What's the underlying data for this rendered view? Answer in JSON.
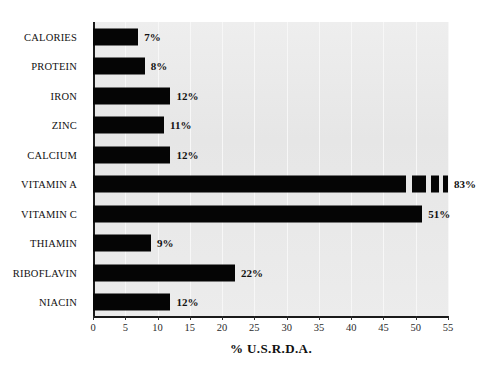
{
  "chart_data": {
    "type": "bar",
    "orientation": "horizontal",
    "title": "",
    "xlabel": "% U.S.R.D.A.",
    "ylabel": "",
    "xlim": [
      0,
      55
    ],
    "xticks": [
      0,
      5,
      10,
      15,
      20,
      25,
      30,
      35,
      40,
      45,
      50,
      55
    ],
    "xtick_labels": [
      "0",
      "5",
      "10",
      "15",
      "20",
      "25",
      "30",
      "35",
      "40",
      "45",
      "50",
      "55"
    ],
    "grid": true,
    "legend": "none",
    "bar_color": "#050505",
    "plot_background": "#e8e8e8",
    "figure_background": "#ffffff",
    "categories": [
      "CALORIES",
      "PROTEIN",
      "IRON",
      "ZINC",
      "CALCIUM",
      "VITAMIN A",
      "VITAMIN C",
      "THIAMIN",
      "RIBOFLAVIN",
      "NIACIN"
    ],
    "values": [
      7,
      8,
      12,
      11,
      12,
      83,
      51,
      9,
      22,
      12
    ],
    "value_labels": [
      "7%",
      "8%",
      "12%",
      "11%",
      "12%",
      "83%",
      "51%",
      "9%",
      "22%",
      "12%"
    ],
    "bars": [
      {
        "category": "CALORIES",
        "value": 7,
        "label": "7%",
        "truncated": false,
        "draw_to": 7
      },
      {
        "category": "PROTEIN",
        "value": 8,
        "label": "8%",
        "truncated": false,
        "draw_to": 8
      },
      {
        "category": "IRON",
        "value": 12,
        "label": "12%",
        "truncated": false,
        "draw_to": 12
      },
      {
        "category": "ZINC",
        "value": 11,
        "label": "11%",
        "truncated": false,
        "draw_to": 11
      },
      {
        "category": "CALCIUM",
        "value": 12,
        "label": "12%",
        "truncated": false,
        "draw_to": 12
      },
      {
        "category": "VITAMIN A",
        "value": 83,
        "label": "83%",
        "truncated": true,
        "draw_to": 55
      },
      {
        "category": "VITAMIN C",
        "value": 51,
        "label": "51%",
        "truncated": false,
        "draw_to": 51
      },
      {
        "category": "THIAMIN",
        "value": 9,
        "label": "9%",
        "truncated": false,
        "draw_to": 9
      },
      {
        "category": "RIBOFLAVIN",
        "value": 22,
        "label": "22%",
        "truncated": false,
        "draw_to": 22
      },
      {
        "category": "NIACIN",
        "value": 12,
        "label": "12%",
        "truncated": false,
        "draw_to": 12
      }
    ]
  }
}
